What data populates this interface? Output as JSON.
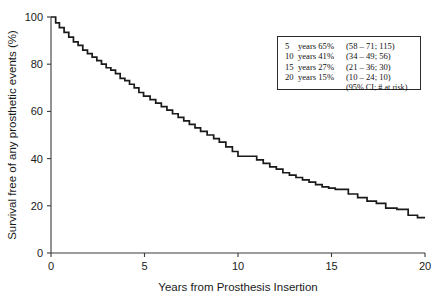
{
  "chart_data": {
    "type": "line",
    "subtype": "kaplan-meier-step",
    "title": "",
    "xlabel": "Years from Prosthesis Insertion",
    "ylabel": "Survival free of any prosthetic events (%)",
    "xlim": [
      0,
      20
    ],
    "ylim": [
      0,
      100
    ],
    "xticks": [
      0,
      5,
      10,
      15,
      20
    ],
    "xticklabels": [
      "0",
      "5",
      "10",
      "15",
      "20"
    ],
    "yticks": [
      0,
      20,
      40,
      60,
      80,
      100
    ],
    "yticklabels": [
      "0",
      "20",
      "40",
      "60",
      "80",
      "100"
    ],
    "grid": false,
    "legend_position": "upper-right",
    "series": [
      {
        "name": "Survival free of any prosthetic events",
        "color": "#1a1a1a",
        "x": [
          0.0,
          0.25,
          0.45,
          0.7,
          0.95,
          1.2,
          1.45,
          1.7,
          1.95,
          2.2,
          2.45,
          2.7,
          2.95,
          3.2,
          3.45,
          3.7,
          3.95,
          4.2,
          4.45,
          4.7,
          4.95,
          5.3,
          5.6,
          5.9,
          6.2,
          6.5,
          6.8,
          7.1,
          7.4,
          7.7,
          8.0,
          8.35,
          8.7,
          9.0,
          9.35,
          9.7,
          10.0,
          10.6,
          11.0,
          11.35,
          11.7,
          12.05,
          12.4,
          12.75,
          13.1,
          13.45,
          13.8,
          14.15,
          14.5,
          14.85,
          15.2,
          15.9,
          16.4,
          16.9,
          17.4,
          17.9,
          18.5,
          19.1,
          19.6
        ],
        "y": [
          100.0,
          97.5,
          95.5,
          93.5,
          91.5,
          89.5,
          88.0,
          86.0,
          84.5,
          83.0,
          81.5,
          80.0,
          78.5,
          77.5,
          76.0,
          74.0,
          73.0,
          71.5,
          70.0,
          68.0,
          66.5,
          65.0,
          63.5,
          62.0,
          60.5,
          59.0,
          57.5,
          56.0,
          54.5,
          53.0,
          51.5,
          50.0,
          48.5,
          47.0,
          45.0,
          43.0,
          41.0,
          41.0,
          39.5,
          38.0,
          36.5,
          35.5,
          34.0,
          33.0,
          32.0,
          31.0,
          30.0,
          29.0,
          28.0,
          27.5,
          27.0,
          25.0,
          23.5,
          22.0,
          21.0,
          19.0,
          18.5,
          16.0,
          15.0
        ]
      }
    ],
    "annotations": [
      {
        "time_years": 5,
        "survival_pct": 65,
        "ci_low": 58,
        "ci_high": 71,
        "at_risk": 115
      },
      {
        "time_years": 10,
        "survival_pct": 41,
        "ci_low": 34,
        "ci_high": 49,
        "at_risk": 56
      },
      {
        "time_years": 15,
        "survival_pct": 27,
        "ci_low": 21,
        "ci_high": 36,
        "at_risk": 30
      },
      {
        "time_years": 20,
        "survival_pct": 15,
        "ci_low": 10,
        "ci_high": 24,
        "at_risk": 10
      }
    ]
  },
  "axes": {
    "y_title": "Survival free of any prosthetic events (%)",
    "x_title": "Years from Prosthesis Insertion",
    "y_tick_labels": [
      "100",
      "80",
      "60",
      "40",
      "20",
      "0"
    ],
    "x_tick_labels": [
      "0",
      "5",
      "10",
      "15",
      "20"
    ]
  },
  "legend": {
    "rows": [
      {
        "years": "5",
        "label": "years",
        "pct": "65%",
        "ci": "(58 – 71; 115)"
      },
      {
        "years": "10",
        "label": "years",
        "pct": "41%",
        "ci": "(34 – 49; 56)"
      },
      {
        "years": "15",
        "label": "years",
        "pct": "27%",
        "ci": "(21 – 36; 30)"
      },
      {
        "years": "20",
        "label": "years",
        "pct": "15%",
        "ci": "(10 – 24; 10)"
      }
    ],
    "footnote": "(95% CI; # at risk)"
  },
  "style": {
    "curve_color": "#1a1a1a",
    "axis_color": "#3a3a3a",
    "background": "#ffffff"
  }
}
